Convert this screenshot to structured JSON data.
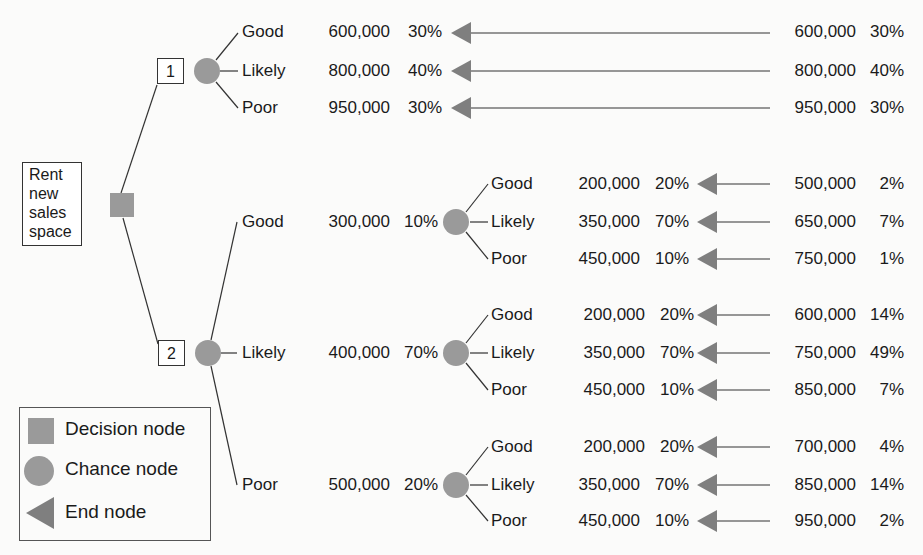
{
  "colors": {
    "node_fill": "#9a9a9a",
    "end_fill": "#7f7f7f",
    "line": "#333333",
    "background": "#fbfbfa"
  },
  "root": {
    "label_lines": [
      "Rent",
      "new",
      "sales",
      "space"
    ]
  },
  "options": [
    {
      "number": "1",
      "outcomes": [
        {
          "label": "Good",
          "value": "600,000",
          "prob": "30%",
          "end_value": "600,000",
          "end_prob": "30%"
        },
        {
          "label": "Likely",
          "value": "800,000",
          "prob": "40%",
          "end_value": "800,000",
          "end_prob": "40%"
        },
        {
          "label": "Poor",
          "value": "950,000",
          "prob": "30%",
          "end_value": "950,000",
          "end_prob": "30%"
        }
      ]
    },
    {
      "number": "2",
      "outcomes": [
        {
          "label": "Good",
          "value": "300,000",
          "prob": "10%",
          "sub": [
            {
              "label": "Good",
              "value": "200,000",
              "prob": "20%",
              "end_value": "500,000",
              "end_prob": "2%"
            },
            {
              "label": "Likely",
              "value": "350,000",
              "prob": "70%",
              "end_value": "650,000",
              "end_prob": "7%"
            },
            {
              "label": "Poor",
              "value": "450,000",
              "prob": "10%",
              "end_value": "750,000",
              "end_prob": "1%"
            }
          ]
        },
        {
          "label": "Likely",
          "value": "400,000",
          "prob": "70%",
          "sub": [
            {
              "label": "Good",
              "value": "200,000",
              "prob": "20%",
              "end_value": "600,000",
              "end_prob": "14%"
            },
            {
              "label": "Likely",
              "value": "350,000",
              "prob": "70%",
              "end_value": "750,000",
              "end_prob": "49%"
            },
            {
              "label": "Poor",
              "value": "450,000",
              "prob": "10%",
              "end_value": "850,000",
              "end_prob": "7%"
            }
          ]
        },
        {
          "label": "Poor",
          "value": "500,000",
          "prob": "20%",
          "sub": [
            {
              "label": "Good",
              "value": "200,000",
              "prob": "20%",
              "end_value": "700,000",
              "end_prob": "4%"
            },
            {
              "label": "Likely",
              "value": "350,000",
              "prob": "70%",
              "end_value": "850,000",
              "end_prob": "14%"
            },
            {
              "label": "Poor",
              "value": "450,000",
              "prob": "10%",
              "end_value": "950,000",
              "end_prob": "2%"
            }
          ]
        }
      ]
    }
  ],
  "legend": {
    "items": [
      {
        "shape": "square",
        "label": "Decision node"
      },
      {
        "shape": "circle",
        "label": "Chance node"
      },
      {
        "shape": "triangle",
        "label": "End node"
      }
    ]
  }
}
